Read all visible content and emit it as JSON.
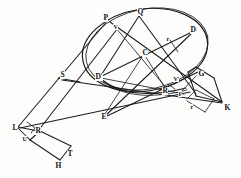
{
  "figure": {
    "background_color": "#fdfdfc",
    "line_color": "#1c1c1c",
    "label_color": "#0d0d0d",
    "width": 241,
    "height": 178
  },
  "points": [
    {
      "id": "P",
      "label": "P",
      "x": 103,
      "y": 14,
      "size": "normal"
    },
    {
      "id": "V",
      "label": "V",
      "x": 113,
      "y": 24,
      "size": "small"
    },
    {
      "id": "Q",
      "label": "Q",
      "x": 137,
      "y": 8,
      "size": "normal"
    },
    {
      "id": "D",
      "label": "D",
      "x": 190,
      "y": 26,
      "size": "normal"
    },
    {
      "id": "r1",
      "label": "r",
      "x": 166,
      "y": 36,
      "size": "small"
    },
    {
      "id": "C",
      "label": "C",
      "x": 142,
      "y": 49,
      "size": "normal"
    },
    {
      "id": "S",
      "label": "S",
      "x": 60,
      "y": 71,
      "size": "normal"
    },
    {
      "id": "Dp",
      "label": "D'",
      "x": 95,
      "y": 73,
      "size": "normal"
    },
    {
      "id": "Vp",
      "label": "V'",
      "x": 173,
      "y": 76,
      "size": "small"
    },
    {
      "id": "G",
      "label": "G",
      "x": 198,
      "y": 70,
      "size": "normal"
    },
    {
      "id": "R2",
      "label": "R",
      "x": 162,
      "y": 87,
      "size": "normal"
    },
    {
      "id": "F",
      "label": "F",
      "x": 178,
      "y": 91,
      "size": "small"
    },
    {
      "id": "r2",
      "label": "r",
      "x": 190,
      "y": 104,
      "size": "small"
    },
    {
      "id": "K",
      "label": "K",
      "x": 224,
      "y": 104,
      "size": "normal"
    },
    {
      "id": "E",
      "label": "E",
      "x": 101,
      "y": 113,
      "size": "normal"
    },
    {
      "id": "L",
      "label": "L",
      "x": 12,
      "y": 124,
      "size": "normal"
    },
    {
      "id": "R1",
      "label": "R",
      "x": 35,
      "y": 127,
      "size": "normal"
    },
    {
      "id": "U",
      "label": "U",
      "x": 22,
      "y": 136,
      "size": "small"
    },
    {
      "id": "T",
      "label": "T",
      "x": 67,
      "y": 150,
      "size": "normal"
    },
    {
      "id": "H",
      "label": "H",
      "x": 55,
      "y": 162,
      "size": "normal"
    }
  ],
  "geometry_notes": {
    "conic": "large ellipse rotated, passing through P, Q, D, D' with centre C",
    "secondary_arc": "lower flat arc from D' through E-region to F/G",
    "left_quadrilateral": "L-S region quadrilateral with vertices L, U, R, H, T",
    "right_quadrilateral": "G, K, r quadrilateral on right flank",
    "chords": "PD, QD', QE, PK, SK, LD, LE, CE, CG, RF"
  }
}
